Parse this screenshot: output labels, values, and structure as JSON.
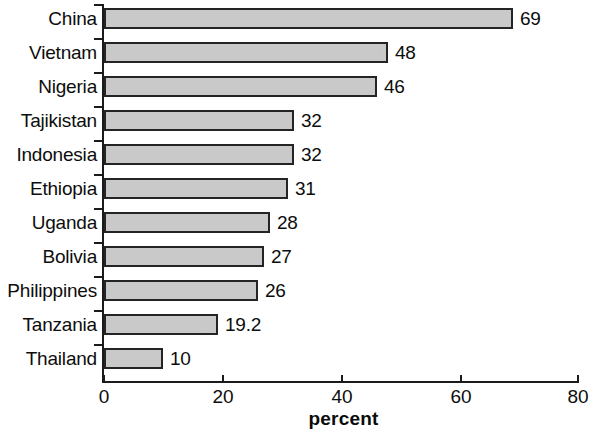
{
  "chart_data": {
    "type": "bar",
    "orientation": "horizontal",
    "title": "",
    "subtitle": "",
    "xlabel": "percent",
    "ylabel": "",
    "categories": [
      "China",
      "Vietnam",
      "Nigeria",
      "Tajikistan",
      "Indonesia",
      "Ethiopia",
      "Uganda",
      "Bolivia",
      "Philippines",
      "Tanzania",
      "Thailand"
    ],
    "values": [
      69,
      48,
      46,
      32,
      32,
      31,
      28,
      27,
      26,
      19.2,
      10
    ],
    "value_labels": [
      "69",
      "48",
      "46",
      "32",
      "32",
      "31",
      "28",
      "27",
      "26",
      "19.2",
      "10"
    ],
    "xlim": [
      0,
      80
    ],
    "xticks": [
      0,
      20,
      40,
      60,
      80
    ],
    "xtick_labels": [
      "0",
      "20",
      "40",
      "60",
      "80"
    ],
    "grid": false,
    "legend": false,
    "bar_fill_color": "#c9c9c9",
    "bar_edge_color": "#242424",
    "axis_color": "#1b1b1b",
    "text_color": "#0d0d0d",
    "background_color": "#ffffff"
  }
}
